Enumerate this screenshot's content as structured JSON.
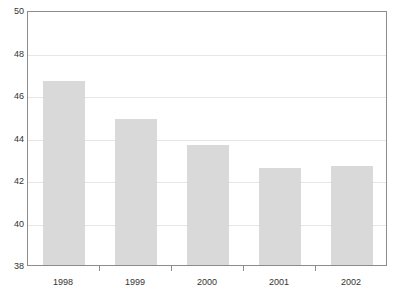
{
  "chart_data": {
    "type": "bar",
    "title": "",
    "xlabel": "",
    "ylabel": "",
    "categories": [
      "1998",
      "1999",
      "2000",
      "2001",
      "2002"
    ],
    "values": [
      46.65,
      44.85,
      43.65,
      42.55,
      42.65
    ],
    "series": [
      {
        "name": "",
        "values": [
          46.65,
          44.85,
          43.65,
          42.55,
          42.65
        ]
      }
    ],
    "ylim": [
      38,
      50
    ],
    "yticks": [
      38,
      40,
      42,
      44,
      46,
      48,
      50
    ],
    "ytick_labels": [
      "38",
      "40",
      "42",
      "44",
      "46",
      "48",
      "50"
    ],
    "xtick_labels": [
      "1998",
      "1999",
      "2000",
      "2001",
      "2002"
    ],
    "grid": true,
    "grid_axis": "y",
    "legend": false,
    "legend_position": "none",
    "bar_color": "#d9d9d9",
    "gridline_color": "#e6e6e6",
    "axis_color": "#8c8c8c",
    "text_color": "#333333",
    "background_color": "#ffffff",
    "annotations": []
  }
}
